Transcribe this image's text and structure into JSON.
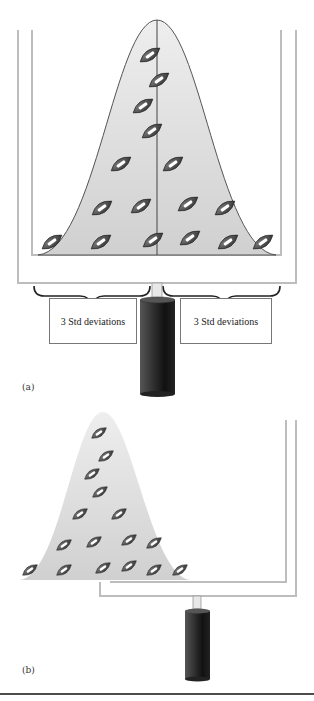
{
  "panel_a": {
    "label": "(a)",
    "left_box": "3 Std deviations",
    "right_box": "3 Std deviations",
    "footballs": [
      [
        150,
        55
      ],
      [
        159,
        80
      ],
      [
        143,
        106
      ],
      [
        152,
        131
      ],
      [
        121,
        164
      ],
      [
        173,
        164
      ],
      [
        102,
        208
      ],
      [
        141,
        206
      ],
      [
        188,
        204
      ],
      [
        225,
        208
      ],
      [
        52,
        242
      ],
      [
        101,
        242
      ],
      [
        153,
        240
      ],
      [
        190,
        238
      ],
      [
        228,
        242
      ],
      [
        263,
        242
      ]
    ]
  },
  "panel_b": {
    "label": "(b)",
    "footballs": [
      [
        99,
        433
      ],
      [
        106,
        456
      ],
      [
        92,
        474
      ],
      [
        100,
        492
      ],
      [
        80,
        514
      ],
      [
        119,
        514
      ],
      [
        64,
        545
      ],
      [
        94,
        542
      ],
      [
        129,
        540
      ],
      [
        154,
        543
      ],
      [
        30,
        570
      ],
      [
        64,
        570
      ],
      [
        103,
        568
      ],
      [
        129,
        566
      ],
      [
        154,
        570
      ],
      [
        180,
        570
      ]
    ]
  },
  "colors": {
    "curve_fill": "#e4e4e4",
    "post": "#c8c8c8",
    "ball": "#4a4a4a",
    "cylinder": "#2a2a2a"
  }
}
